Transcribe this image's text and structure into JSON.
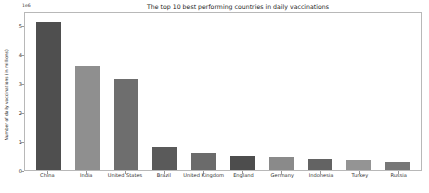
{
  "chart_data": {
    "type": "bar",
    "title": "The top 10 best performing countries in daily vaccinations",
    "xlabel": "",
    "ylabel": "Number of daily vaccinations (in millions)",
    "offset_text": "1e6",
    "categories": [
      "China",
      "India",
      "United States",
      "Brazil",
      "United Kingdom",
      "England",
      "Germany",
      "Indonesia",
      "Turkey",
      "Russia"
    ],
    "values": [
      5.2,
      3.65,
      3.2,
      0.8,
      0.58,
      0.48,
      0.45,
      0.4,
      0.36,
      0.29
    ],
    "bar_colors": [
      "#4f4f4f",
      "#8f8f8f",
      "#6e6e6e",
      "#5a5a5a",
      "#6b6b6b",
      "#4d4d4d",
      "#8a8a8a",
      "#636363",
      "#949494",
      "#777777"
    ],
    "ylim": [
      0,
      5.5
    ],
    "yticks": [
      0,
      1,
      2,
      3,
      4,
      5
    ],
    "ytick_labels": [
      "0",
      "1",
      "2",
      "3",
      "4",
      "5"
    ],
    "grid": false,
    "legend": null
  },
  "figure": {
    "background_color": "#ffffff",
    "axes_edge_color": "#b8b8b8",
    "tick_color": "#999999",
    "text_color": "#1a1a1a"
  }
}
